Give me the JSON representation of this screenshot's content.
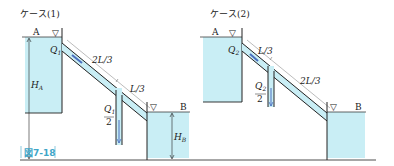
{
  "figure": {
    "caption": "図7-18",
    "colors": {
      "water": "#c9eef5",
      "line": "#222222",
      "flow_arrow": "#4a6fbf",
      "caption": "#3fa6c8"
    }
  },
  "case1": {
    "title": "ケース(1)",
    "tank_a_label": "A",
    "tank_b_label": "B",
    "flow_label": "Q",
    "flow_sub": "1",
    "branch_flow_num": "Q",
    "branch_flow_sub": "1",
    "branch_flow_den": "2",
    "segment_upper": "2L/3",
    "segment_lower": "L/3",
    "head_a": "H",
    "head_a_sub": "A",
    "head_b": "H",
    "head_b_sub": "B",
    "surface_symbol": "▽"
  },
  "case2": {
    "title": "ケース(2)",
    "tank_a_label": "A",
    "tank_b_label": "B",
    "flow_label": "Q",
    "flow_sub": "2",
    "branch_flow_num": "Q",
    "branch_flow_sub": "2",
    "branch_flow_den": "2",
    "segment_upper": "L/3",
    "segment_lower": "2L/3",
    "surface_symbol": "▽"
  }
}
